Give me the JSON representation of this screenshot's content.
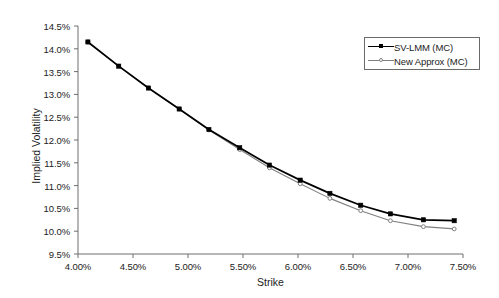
{
  "chart_data": {
    "type": "line",
    "title": "",
    "xlabel": "Strike",
    "ylabel": "Implied Volatility",
    "xlim": [
      4.0,
      7.5
    ],
    "ylim": [
      9.5,
      14.5
    ],
    "grid": false,
    "legend_position": "top-right",
    "x_tick_labels": [
      "4.00%",
      "4.50%",
      "5.00%",
      "5.50%",
      "6.00%",
      "6.50%",
      "7.00%",
      "7.50%"
    ],
    "x_tick_values": [
      4.0,
      4.5,
      5.0,
      5.5,
      6.0,
      6.5,
      7.0,
      7.5
    ],
    "y_tick_labels": [
      "9.5%",
      "10.0%",
      "10.5%",
      "11.0%",
      "11.5%",
      "12.0%",
      "12.5%",
      "13.0%",
      "13.5%",
      "14.0%",
      "14.5%"
    ],
    "y_tick_values": [
      9.5,
      10.0,
      10.5,
      11.0,
      11.5,
      12.0,
      12.5,
      13.0,
      13.5,
      14.0,
      14.5
    ],
    "x": [
      4.09,
      4.37,
      4.64,
      4.92,
      5.19,
      5.47,
      5.74,
      6.02,
      6.29,
      6.57,
      6.84,
      7.14,
      7.42
    ],
    "series": [
      {
        "name": "SV-LMM (MC)",
        "color": "#000000",
        "marker": "filled-square",
        "values": [
          14.15,
          13.62,
          13.14,
          12.68,
          12.23,
          11.83,
          11.45,
          11.12,
          10.83,
          10.57,
          10.38,
          10.25,
          10.23
        ]
      },
      {
        "name": "New Approx (MC)",
        "color": "#808080",
        "marker": "open-circle",
        "values": [
          14.15,
          13.62,
          13.14,
          12.68,
          12.22,
          11.79,
          11.39,
          11.04,
          10.72,
          10.45,
          10.23,
          10.1,
          10.05
        ]
      }
    ]
  },
  "legend": {
    "entries": [
      {
        "label": "SV-LMM (MC)"
      },
      {
        "label": "New Approx (MC)"
      }
    ]
  },
  "axes": {
    "x_title": "Strike",
    "y_title": "Implied Volatility"
  }
}
